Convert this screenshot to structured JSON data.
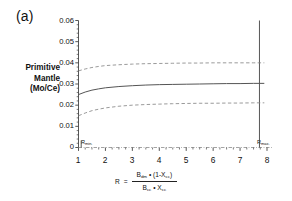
{
  "figure": {
    "panel_label": "(a)",
    "background_color": "#ffffff",
    "axis_color": "#444444",
    "solid_curve_color": "#555555",
    "dashed_curve_color": "#888888",
    "baseline_color": "#9a9a9a"
  },
  "y_axis": {
    "title_lines": [
      "Primitive",
      "Mantle",
      "(Mo/Ce)"
    ],
    "tick_labels": [
      "0",
      "0.01",
      "0.02",
      "0.03",
      "0.04",
      "0.05",
      "0.06"
    ]
  },
  "x_axis": {
    "tick_labels": [
      "1",
      "2",
      "3",
      "4",
      "5",
      "6",
      "7",
      "8"
    ],
    "equation": {
      "lhs": "R",
      "equals": "=",
      "numerator_b": "B",
      "numerator_b_sub": "dm",
      "numerator_dot": "•",
      "numerator_paren_open": "(1-X",
      "numerator_x_sub": "cc",
      "numerator_paren_close": ")",
      "denominator_b": "B",
      "denominator_b_sub": "cc",
      "denominator_dot": "•",
      "denominator_x": "X",
      "denominator_x_sub": "cc"
    }
  },
  "annotations": {
    "r_min_label": "R",
    "r_min_sub": "min.",
    "r_max_label": "R",
    "r_max_sub": "max."
  },
  "chart_data": {
    "type": "line",
    "title": "",
    "xlabel": "R = [B_dm • (1-X_cc)] / [B_cc • X_cc]",
    "ylabel": "Primitive Mantle (Mo/Ce)",
    "xlim": [
      1,
      8
    ],
    "ylim": [
      0,
      0.06
    ],
    "xticks": [
      1,
      2,
      3,
      4,
      5,
      6,
      7,
      8
    ],
    "yticks": [
      0,
      0.01,
      0.02,
      0.03,
      0.04,
      0.05,
      0.06
    ],
    "minor_tick_step": 0.25,
    "grid": false,
    "legend": null,
    "x": [
      1.0,
      1.25,
      1.5,
      1.75,
      2.0,
      2.5,
      3.0,
      3.5,
      4.0,
      4.5,
      5.0,
      5.5,
      6.0,
      6.5,
      7.0,
      7.5,
      7.72,
      7.9
    ],
    "series": [
      {
        "name": "upper bound",
        "style": "dashed",
        "values": [
          0.0362,
          0.0371,
          0.0378,
          0.0383,
          0.0387,
          0.0391,
          0.0394,
          0.0396,
          0.0397,
          0.0398,
          0.0399,
          0.0399,
          0.04,
          0.04,
          0.04,
          0.04,
          0.04,
          0.04
        ]
      },
      {
        "name": "best estimate",
        "style": "solid",
        "values": [
          0.025,
          0.0262,
          0.0271,
          0.0277,
          0.0282,
          0.0288,
          0.0292,
          0.0295,
          0.0297,
          0.0298,
          0.0299,
          0.03,
          0.0301,
          0.0302,
          0.0302,
          0.0303,
          0.0303,
          0.0303
        ]
      },
      {
        "name": "lower bound",
        "style": "dashed",
        "values": [
          0.015,
          0.0163,
          0.0174,
          0.0181,
          0.0187,
          0.0195,
          0.02,
          0.0203,
          0.0205,
          0.0207,
          0.0208,
          0.0209,
          0.0209,
          0.021,
          0.021,
          0.0211,
          0.0211,
          0.0211
        ]
      },
      {
        "name": "baseline",
        "style": "dash-dot",
        "values": [
          0.0,
          0.0,
          0.0,
          0.0,
          0.0,
          0.0,
          0.0,
          0.0,
          0.0,
          0.0,
          0.0,
          0.0,
          0.0,
          0.0,
          0.0,
          0.0,
          0.0,
          0.0
        ]
      }
    ],
    "vertical_markers": [
      {
        "name": "R_min",
        "x": 1.1,
        "label": "R min."
      },
      {
        "name": "R_max",
        "x": 7.72,
        "label": "R max."
      }
    ]
  }
}
